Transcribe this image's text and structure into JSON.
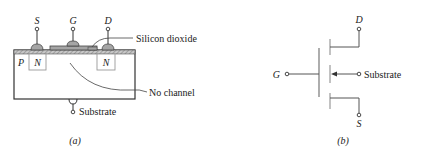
{
  "panel_a": {
    "caption": "(a)",
    "terminals": {
      "source": "S",
      "gate": "G",
      "drain": "D"
    },
    "regions": {
      "body": "P",
      "source_well": "N",
      "drain_well": "N"
    },
    "annotations": {
      "oxide": "Silicon dioxide",
      "channel": "No channel",
      "substrate": "Substrate"
    }
  },
  "panel_b": {
    "caption": "(b)",
    "terminals": {
      "drain": "D",
      "gate": "G",
      "source": "S",
      "substrate": "Substrate"
    }
  },
  "colors": {
    "line": "#333333",
    "oxide_fill": "#b8b8b8",
    "gate_fill": "#9a9a9a",
    "well_stroke": "#9a9a9a"
  }
}
